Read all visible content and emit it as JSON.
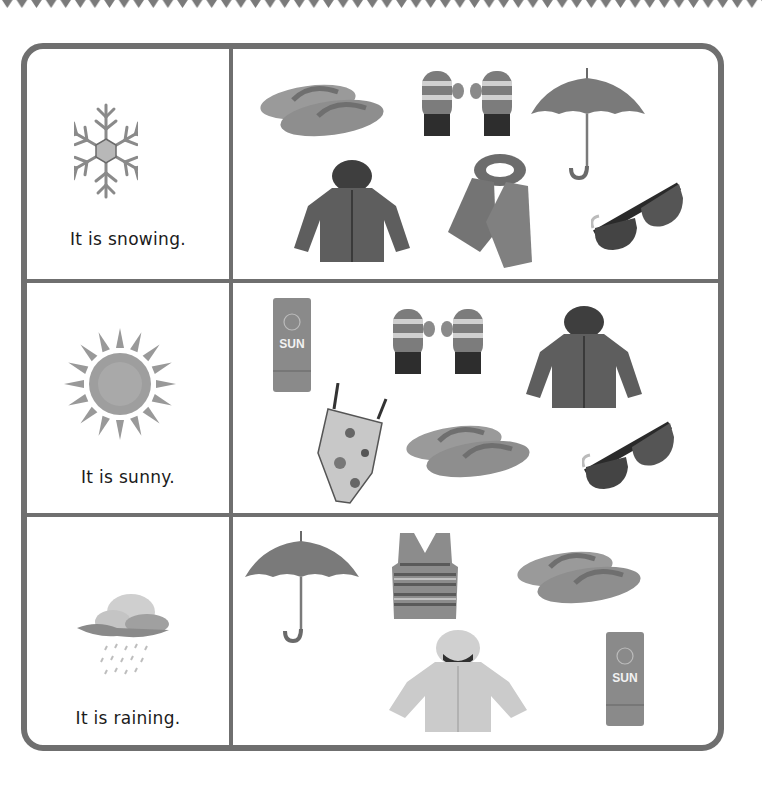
{
  "worksheet": {
    "rows": [
      {
        "weather": "snowing",
        "weather_icon": "snowflake-icon",
        "caption": "It is snowing.",
        "items": [
          "flip-flops",
          "mittens",
          "umbrella",
          "winter-jacket",
          "scarf",
          "sunglasses"
        ]
      },
      {
        "weather": "sunny",
        "weather_icon": "sun-icon",
        "caption": "It is sunny.",
        "items": [
          "sunscreen",
          "mittens",
          "winter-jacket",
          "swimsuit",
          "flip-flops",
          "sunglasses"
        ]
      },
      {
        "weather": "raining",
        "weather_icon": "rain-cloud-icon",
        "caption": "It is raining.",
        "items": [
          "umbrella",
          "sweater-vest",
          "flip-flops",
          "raincoat",
          "sunscreen"
        ]
      }
    ],
    "sunscreen_label": "SUN",
    "colors": {
      "border": "#6f6f6f",
      "text": "#1b1b1b",
      "background": "#ffffff"
    }
  }
}
